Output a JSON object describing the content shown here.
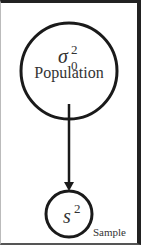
{
  "diagram": {
    "nodes": [
      {
        "id": "population",
        "symbol": "σ",
        "superscript": "2",
        "subscript": "0",
        "label": "Population"
      },
      {
        "id": "sample",
        "symbol": "s",
        "superscript": "2",
        "label": "Sample"
      }
    ],
    "edges": [
      {
        "from": "population",
        "to": "sample",
        "style": "arrow"
      }
    ],
    "colors": {
      "stroke": "#1a1a1a",
      "text": "#333333",
      "background": "#ffffff"
    }
  }
}
